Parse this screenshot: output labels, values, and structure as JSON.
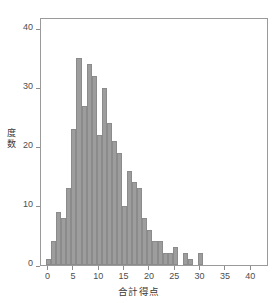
{
  "chart_data": {
    "type": "bar",
    "title": "",
    "subtitle": "",
    "xlabel": "合計得点",
    "ylabel": "度数",
    "ylabel_chars": [
      "度",
      "数"
    ],
    "xlim": [
      -1.5,
      43.5
    ],
    "ylim": [
      0,
      42
    ],
    "grid": false,
    "legend": null,
    "bin_width": 1,
    "bar_color": "#9d9d9d",
    "bar_edge_color": "#8b8b8b",
    "axis_color": "#9a9a9a",
    "text_color": "#4d4d4d",
    "background": "#ffffff",
    "x_ticks": [
      0,
      5,
      10,
      15,
      20,
      25,
      30,
      35,
      40
    ],
    "x_tick_labels": [
      "0",
      "5",
      "10",
      "15",
      "20",
      "25",
      "30",
      "35",
      "40"
    ],
    "y_ticks": [
      0,
      10,
      20,
      30,
      40
    ],
    "y_tick_labels": [
      "0",
      "10",
      "20",
      "30",
      "40"
    ],
    "categories": [
      0,
      1,
      2,
      3,
      4,
      5,
      6,
      7,
      8,
      9,
      10,
      11,
      12,
      13,
      14,
      15,
      16,
      17,
      18,
      19,
      20,
      21,
      22,
      23,
      24,
      25,
      27,
      28,
      30
    ],
    "values": [
      1,
      4,
      9,
      8,
      13,
      23,
      35,
      27,
      34,
      32,
      22,
      30,
      24,
      21,
      19,
      10,
      16,
      14,
      13,
      8,
      6,
      4,
      4,
      2,
      2,
      3,
      2,
      1,
      2
    ],
    "bars": [
      {
        "x": 0,
        "value": 1
      },
      {
        "x": 1,
        "value": 4
      },
      {
        "x": 2,
        "value": 9
      },
      {
        "x": 3,
        "value": 8
      },
      {
        "x": 4,
        "value": 13
      },
      {
        "x": 5,
        "value": 23
      },
      {
        "x": 6,
        "value": 35
      },
      {
        "x": 7,
        "value": 27
      },
      {
        "x": 8,
        "value": 34
      },
      {
        "x": 9,
        "value": 32
      },
      {
        "x": 10,
        "value": 22
      },
      {
        "x": 11,
        "value": 30
      },
      {
        "x": 12,
        "value": 24
      },
      {
        "x": 13,
        "value": 21
      },
      {
        "x": 14,
        "value": 19
      },
      {
        "x": 15,
        "value": 10
      },
      {
        "x": 16,
        "value": 16
      },
      {
        "x": 17,
        "value": 14
      },
      {
        "x": 18,
        "value": 13
      },
      {
        "x": 19,
        "value": 8
      },
      {
        "x": 20,
        "value": 6
      },
      {
        "x": 21,
        "value": 4
      },
      {
        "x": 22,
        "value": 4
      },
      {
        "x": 23,
        "value": 2
      },
      {
        "x": 24,
        "value": 2
      },
      {
        "x": 25,
        "value": 3
      },
      {
        "x": 27,
        "value": 2
      },
      {
        "x": 28,
        "value": 1
      },
      {
        "x": 30,
        "value": 2
      }
    ]
  }
}
